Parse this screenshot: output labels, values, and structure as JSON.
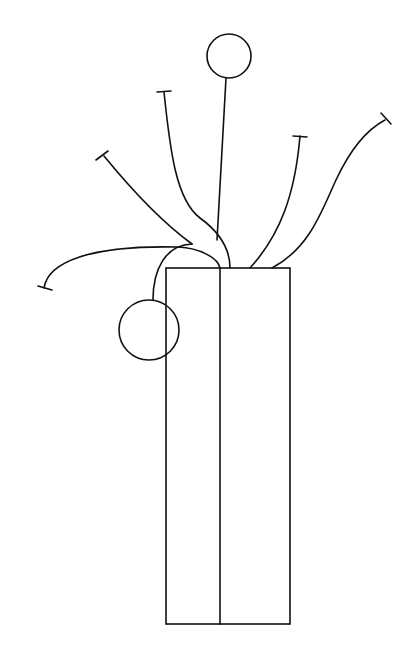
{
  "drawing": {
    "title": "Line drawing of a vase with flower stems",
    "stroke_color": "#111111",
    "background": "#ffffff",
    "elements": [
      "vase-rectangle",
      "vase-divider",
      "top-circle-flower",
      "side-circle-flower",
      "stem-far-left",
      "stem-left",
      "stem-center-left",
      "stem-center",
      "stem-right",
      "stem-far-right"
    ]
  }
}
